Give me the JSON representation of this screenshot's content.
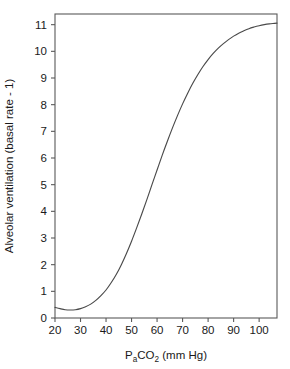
{
  "chart_data": {
    "type": "line",
    "title": "",
    "xlabel": "PaCO2 (mm Hg)",
    "xlabel_parts": {
      "lead": "P",
      "sub1": "a",
      "mid": "CO",
      "sub2": "2",
      "tail": " (mm Hg)"
    },
    "ylabel": "Alveolar ventilation (basal rate - 1)",
    "xlim": [
      20,
      107
    ],
    "ylim": [
      0,
      11.4
    ],
    "grid": false,
    "legend": "none",
    "xticks": [
      20,
      30,
      40,
      50,
      60,
      70,
      80,
      90,
      100
    ],
    "xtick_labels": [
      "20",
      "30",
      "40",
      "50",
      "60",
      "70",
      "80",
      "90",
      "100"
    ],
    "yticks": [
      0,
      1,
      2,
      3,
      4,
      5,
      6,
      7,
      8,
      9,
      10,
      11
    ],
    "ytick_labels": [
      "0",
      "1",
      "2",
      "3",
      "4",
      "5",
      "6",
      "7",
      "8",
      "9",
      "10",
      "11"
    ],
    "series": [
      {
        "name": "Alveolar ventilation response",
        "color": "#4a4a4a",
        "x": [
          20,
          22,
          24,
          26,
          28,
          30,
          32,
          34,
          36,
          38,
          40,
          42,
          44,
          46,
          48,
          50,
          52,
          54,
          56,
          58,
          60,
          62,
          64,
          66,
          68,
          70,
          72,
          74,
          76,
          78,
          80,
          82,
          84,
          86,
          88,
          90,
          92,
          94,
          96,
          98,
          100,
          102,
          104,
          106,
          107
        ],
        "y": [
          0.4,
          0.35,
          0.31,
          0.3,
          0.31,
          0.35,
          0.42,
          0.52,
          0.66,
          0.84,
          1.05,
          1.32,
          1.63,
          2.0,
          2.42,
          2.88,
          3.38,
          3.9,
          4.44,
          5.0,
          5.55,
          6.1,
          6.62,
          7.12,
          7.59,
          8.03,
          8.43,
          8.8,
          9.13,
          9.43,
          9.69,
          9.92,
          10.12,
          10.29,
          10.44,
          10.57,
          10.68,
          10.77,
          10.85,
          10.91,
          10.96,
          11.0,
          11.03,
          11.05,
          11.06
        ]
      }
    ]
  }
}
